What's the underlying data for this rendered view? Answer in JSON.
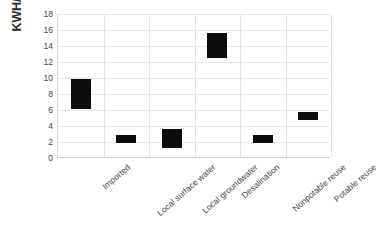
{
  "chart_data": {
    "type": "bar",
    "bar_style": "floating-range",
    "title": "",
    "subtitle": "",
    "xlabel": "",
    "ylabel": "KWH/kgal",
    "categories": [
      "Imported",
      "Local surface water",
      "Local groundwater",
      "Desalination",
      "Nonpotable reuse",
      "Potable reuse"
    ],
    "series": [
      {
        "name": "Energy intensity range",
        "low": [
          6.1,
          1.9,
          1.3,
          12.5,
          1.9,
          4.7
        ],
        "high": [
          9.9,
          2.9,
          3.6,
          15.6,
          2.9,
          5.8
        ]
      }
    ],
    "ylim": [
      0,
      18
    ],
    "yticks": [
      0,
      2,
      4,
      6,
      8,
      10,
      12,
      14,
      16,
      18
    ],
    "ytick_labels": [
      "0",
      "2",
      "4",
      "6",
      "8",
      "10",
      "12",
      "14",
      "16",
      "18"
    ],
    "grid": {
      "horizontal": true,
      "vertical": true,
      "color": "#e9e9e9"
    },
    "legend": {
      "visible": false,
      "position": "none"
    },
    "colors": {
      "bar": "#0d0d0d",
      "axis": "#d3d3d3",
      "grid": "#e9e9e9",
      "text": "#454545",
      "background": "#ffffff"
    }
  }
}
